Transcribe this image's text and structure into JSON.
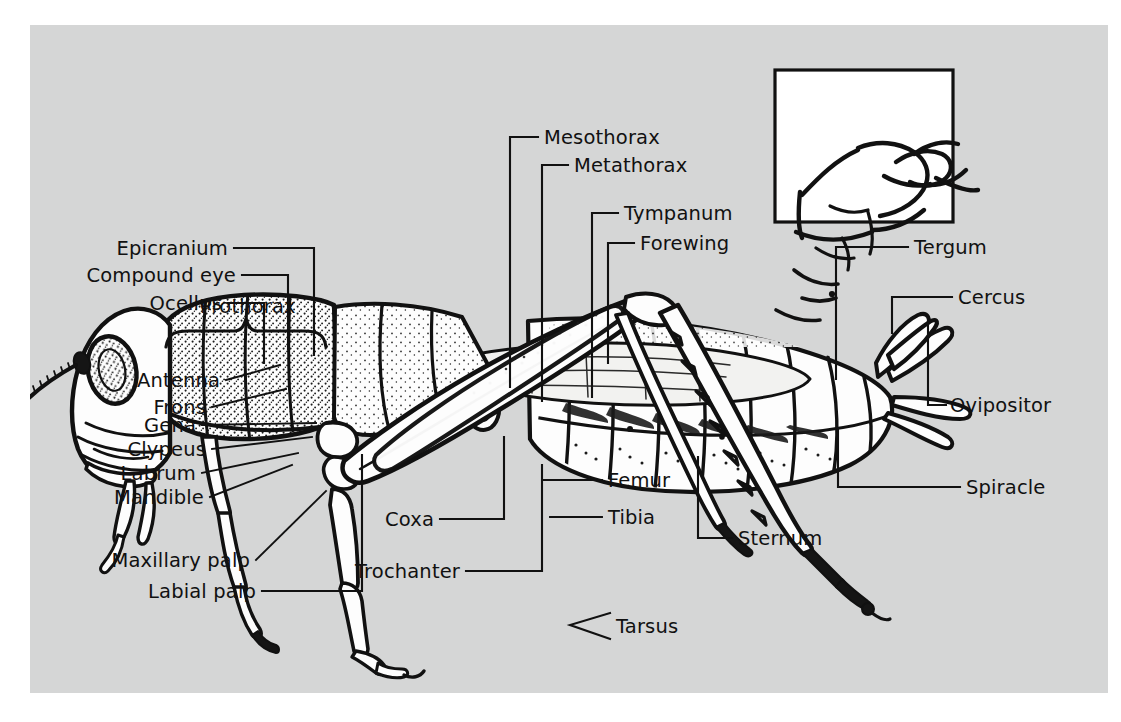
{
  "figure": {
    "background_color": "#d5d6d6",
    "page_color": "#ffffff",
    "ink_color": "#111111"
  },
  "inset": {
    "name": "abdomen-tip-detail",
    "border_color": "#111111",
    "fill_color": "#ffffff"
  },
  "labels": {
    "epicranium": "Epicranium",
    "compound_eye": "Compound eye",
    "ocellus": "Ocellus",
    "antenna": "Antenna",
    "frons": "Frons",
    "gena": "Gena",
    "clypeus": "Clypeus",
    "labrum": "Labrum",
    "mandible": "Mandible",
    "maxillary_palp": "Maxillary palp",
    "labial_palp": "Labial palp",
    "prothorax": "Prothorax",
    "mesothorax": "Mesothorax",
    "metathorax": "Metathorax",
    "tympanum": "Tympanum",
    "forewing": "Forewing",
    "tergum": "Tergum",
    "cercus": "Cercus",
    "ovipositor": "Ovipositor",
    "spiracle": "Spiracle",
    "coxa": "Coxa",
    "trochanter": "Trochanter",
    "femur": "Femur",
    "tibia": "Tibia",
    "tarsus": "Tarsus",
    "sternum": "Sternum"
  },
  "label_list": [
    "Epicranium",
    "Compound eye",
    "Ocellus",
    "Antenna",
    "Frons",
    "Gena",
    "Clypeus",
    "Labrum",
    "Mandible",
    "Maxillary palp",
    "Labial palp",
    "Prothorax",
    "Mesothorax",
    "Metathorax",
    "Tympanum",
    "Forewing",
    "Tergum",
    "Cercus",
    "Ovipositor",
    "Spiracle",
    "Coxa",
    "Trochanter",
    "Femur",
    "Tibia",
    "Tarsus",
    "Sternum"
  ]
}
